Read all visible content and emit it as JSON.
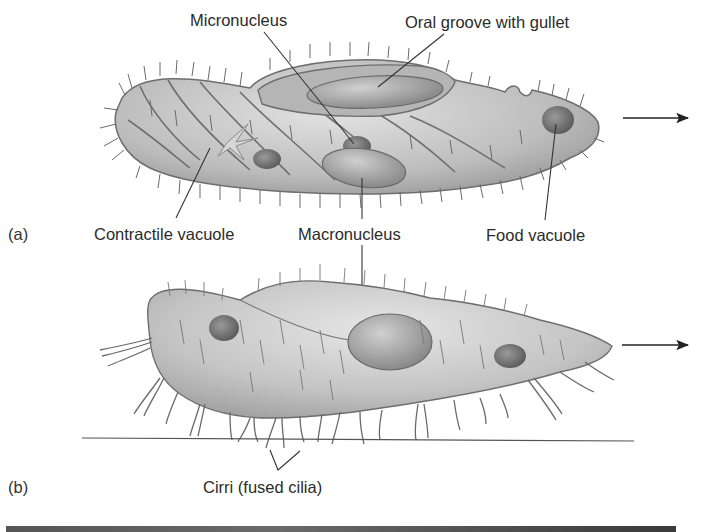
{
  "figure": {
    "panels": [
      {
        "id": "a",
        "tag": "(a)",
        "organism": "ciliate with spiral body grooves (Paramecium-like), swimming right",
        "labels": {
          "micronucleus": "Micronucleus",
          "oral_groove": "Oral groove with gullet",
          "contractile_vacuole": "Contractile vacuole",
          "macronucleus": "Macronucleus",
          "food_vacuole": "Food vacuole"
        },
        "direction_arrow": "arrow-right"
      },
      {
        "id": "b",
        "tag": "(b)",
        "organism": "ciliate walking on substrate using cirri (Stylonychia-like), moving right",
        "labels": {
          "cirri": "Cirri (fused cilia)"
        },
        "direction_arrow": "arrow-right"
      }
    ],
    "colors": {
      "body_fill": "#c8c8c8",
      "body_shadow": "#9a9a9a",
      "outline": "#6e6e6e",
      "nucleus": "#7a7a7a",
      "text": "#2b2b2b",
      "leader_line": "#333333",
      "bottom_bar": "#555555"
    }
  }
}
